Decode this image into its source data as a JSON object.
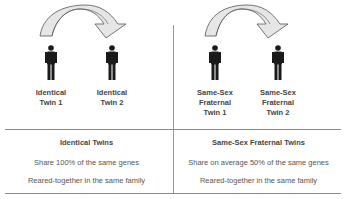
{
  "left": {
    "twin1_label": [
      "Identical",
      "Twin 1"
    ],
    "twin2_label": [
      "Identical",
      "Twin 2"
    ],
    "table": {
      "header": "Identical Twins",
      "line1": "Share 100% of the same genes",
      "line2": "Reared-together in the same family"
    }
  },
  "right": {
    "twin1_label": [
      "Same-Sex",
      "Fraternal",
      "Twin 1"
    ],
    "twin2_label": [
      "Same-Sex",
      "Fraternal",
      "Twin 2"
    ],
    "table": {
      "header": "Same-Sex Fraternal Twins",
      "line1": "Share on average 50% of the same genes",
      "line2": "Reared-together in the same family"
    }
  },
  "colors": {
    "figure": "#1a1a1a",
    "arrow_fill": "#e6e6e6",
    "arrow_stroke": "#555555",
    "divider": "#8a8a8a"
  }
}
